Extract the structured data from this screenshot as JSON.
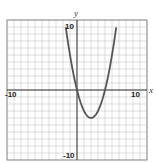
{
  "chart_data": {
    "type": "line",
    "title": "",
    "xlabel": "x",
    "ylabel": "y",
    "xlim": [
      -10,
      10
    ],
    "ylim": [
      -10,
      10
    ],
    "grid": true,
    "tick_labels": {
      "x_min": "-10",
      "x_max": "10",
      "y_min": "-10",
      "y_max": "10"
    },
    "series": [
      {
        "name": "y = x^2 - 4x",
        "x": [
          -1.9,
          -1,
          0,
          1,
          2,
          3,
          4,
          5,
          5.9
        ],
        "values": [
          11.2,
          5,
          0,
          -3,
          -4,
          -3,
          0,
          5,
          11.2
        ]
      }
    ],
    "color": "#555555"
  }
}
